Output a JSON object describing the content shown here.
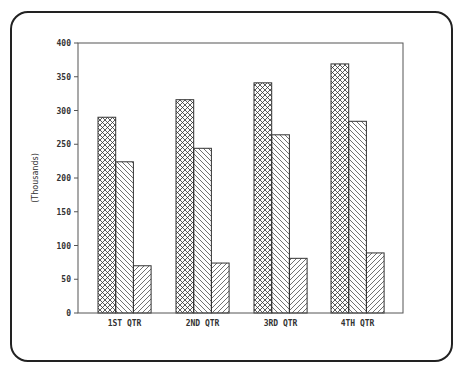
{
  "chart_data": {
    "type": "bar",
    "title": "",
    "xlabel": "",
    "ylabel": "(Thousands)",
    "ylim": [
      0,
      400
    ],
    "yticks": [
      0,
      50,
      100,
      150,
      200,
      250,
      300,
      350,
      400
    ],
    "ytick_labels": [
      "0",
      "50",
      "100",
      "150",
      "200",
      "250",
      "300",
      "350",
      "400"
    ],
    "categories": [
      "1ST QTR",
      "2ND QTR",
      "3RD QTR",
      "4TH QTR"
    ],
    "grid": false,
    "legend": "none",
    "series": [
      {
        "name": "Series 1",
        "pattern": "crosshatch",
        "values": [
          290,
          316,
          341,
          369
        ]
      },
      {
        "name": "Series 2",
        "pattern": "backslash-diagonal",
        "values": [
          224,
          244,
          264,
          284
        ]
      },
      {
        "name": "Series 3",
        "pattern": "forward-slash-diagonal",
        "values": [
          70,
          74,
          81,
          89
        ]
      }
    ],
    "colors": {
      "line": "#333333",
      "background": "#ffffff"
    }
  }
}
